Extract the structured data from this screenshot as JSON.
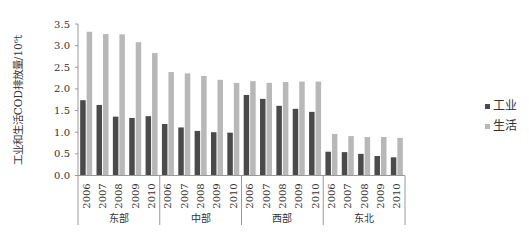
{
  "chart_data": {
    "type": "bar",
    "title": "",
    "xlabel": "",
    "ylabel": "工业和生活COD排放量/10⁶t",
    "ylim": [
      0,
      3.5
    ],
    "yticks": [
      "0.0",
      "0.5",
      "1.0",
      "1.5",
      "2.0",
      "2.5",
      "3.0",
      "3.5"
    ],
    "grid": false,
    "legend_position": "right",
    "groups": [
      "东部",
      "中部",
      "西部",
      "东北"
    ],
    "years": [
      "2006",
      "2007",
      "2008",
      "2009",
      "2010"
    ],
    "categories": [
      "东部 2006",
      "东部 2007",
      "东部 2008",
      "东部 2009",
      "东部 2010",
      "中部 2006",
      "中部 2007",
      "中部 2008",
      "中部 2009",
      "中部 2010",
      "西部 2006",
      "西部 2007",
      "西部 2008",
      "西部 2009",
      "西部 2010",
      "东北 2006",
      "东北 2007",
      "东北 2008",
      "东北 2009",
      "东北 2010"
    ],
    "series": [
      {
        "name": "工业",
        "color": "#4a4a4a",
        "values": [
          1.74,
          1.63,
          1.36,
          1.33,
          1.37,
          1.19,
          1.11,
          1.03,
          1.0,
          0.99,
          1.86,
          1.77,
          1.61,
          1.54,
          1.47,
          0.55,
          0.54,
          0.5,
          0.45,
          0.42
        ]
      },
      {
        "name": "生活",
        "color": "#b8b8b8",
        "values": [
          3.32,
          3.27,
          3.26,
          3.08,
          2.83,
          2.39,
          2.36,
          2.3,
          2.21,
          2.14,
          2.18,
          2.14,
          2.16,
          2.17,
          2.17,
          0.96,
          0.91,
          0.89,
          0.89,
          0.87
        ]
      }
    ]
  }
}
